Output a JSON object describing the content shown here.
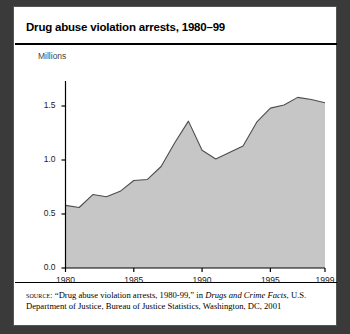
{
  "figure": {
    "title": "Drug abuse violation arrests, 1980–99",
    "unit_label": "Millions",
    "source": {
      "kicker": "source:",
      "quoted_title": "“Drug abuse violation arrests, 1980-99,” in ",
      "publication": "Drugs and Crime Facts",
      "tail": ", U.S. Department of Justice, Bureau of Justice Statistics, Washington, DC, 2001"
    },
    "colors": {
      "area_fill": "#c6c6c6",
      "area_line": "#4d4d4d",
      "axis": "#000000",
      "panel_background": "#ffffff",
      "page_background": "#3a3a3a"
    }
  },
  "chart_data": {
    "type": "area",
    "title": "Drug abuse violation arrests, 1980–99",
    "xlabel": "",
    "ylabel": "Millions",
    "ylim": [
      0.0,
      1.75
    ],
    "xlim": [
      1980,
      1999
    ],
    "yticks": [
      0.0,
      0.5,
      1.0,
      1.5
    ],
    "ytick_labels": [
      "0.0",
      "0.5",
      "1.0",
      "1.5"
    ],
    "xticks": [
      1980,
      1985,
      1990,
      1995,
      1999
    ],
    "xtick_labels": [
      "1980",
      "1985",
      "1990",
      "1995",
      "1999"
    ],
    "grid": false,
    "legend": null,
    "series": [
      {
        "name": "Drug abuse violation arrests",
        "x": [
          1980,
          1981,
          1982,
          1983,
          1984,
          1985,
          1986,
          1987,
          1988,
          1989,
          1990,
          1991,
          1992,
          1993,
          1994,
          1995,
          1996,
          1997,
          1998,
          1999
        ],
        "values": [
          0.58,
          0.56,
          0.68,
          0.66,
          0.71,
          0.81,
          0.82,
          0.94,
          1.16,
          1.36,
          1.09,
          1.01,
          1.07,
          1.13,
          1.35,
          1.48,
          1.51,
          1.58,
          1.56,
          1.53
        ]
      }
    ]
  }
}
